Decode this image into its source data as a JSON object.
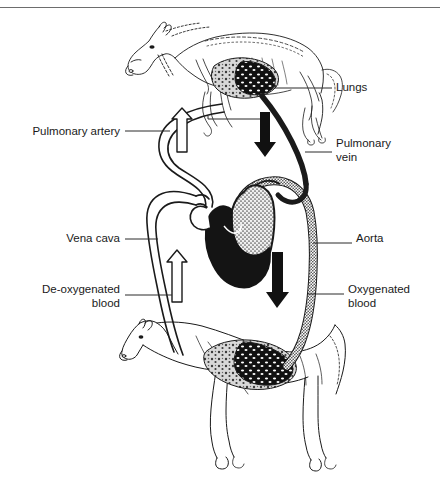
{
  "figure": {
    "colors": {
      "ink": "#1a1a1a",
      "leader_line": "#2a2a2a",
      "oxygenated_fill": "#8a8a8a",
      "deoxygenated_fill": "#1a1a1a",
      "background": "#ffffff",
      "rule": "#6d6d6d"
    }
  },
  "labels": {
    "lungs": "Lungs",
    "pulmonary_artery": "Pulmonary artery",
    "pulmonary_vein": "Pulmonary\nvein",
    "vena_cava": "Vena cava",
    "aorta": "Aorta",
    "deoxygenated_blood": "De-oxygenated\nblood",
    "oxygenated_blood": "Oxygenated\nblood"
  },
  "arrows": [
    {
      "name": "pulmonary-artery-flow",
      "direction": "up",
      "style": "hollow",
      "meaning": "de-oxygenated blood to lungs"
    },
    {
      "name": "pulmonary-vein-flow",
      "direction": "down",
      "style": "solid",
      "meaning": "oxygenated blood from lungs"
    },
    {
      "name": "vena-cava-flow",
      "direction": "up",
      "style": "hollow",
      "meaning": "de-oxygenated blood returning to heart"
    },
    {
      "name": "aorta-flow",
      "direction": "down",
      "style": "solid",
      "meaning": "oxygenated blood to body"
    }
  ],
  "anatomy": {
    "top_horse": "trotting horse with lungs highlighted in thorax",
    "bottom_horse": "standing horse with body tissues highlighted",
    "heart": "four-chambered heart, left side de-oxygenated (dark), right side oxygenated (stippled)"
  }
}
